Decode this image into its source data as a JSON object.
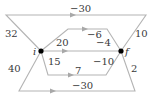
{
  "diagram": {
    "nodes": [
      {
        "id": "i",
        "label": "i",
        "x": 41,
        "y": 51,
        "lx": 33,
        "ly": 55
      },
      {
        "id": "f",
        "label": "f",
        "x": 121,
        "y": 51,
        "lx": 125,
        "ly": 55
      }
    ],
    "colors": {
      "edge": "#b4b4b4",
      "node": "#000000",
      "text": "#3a3a3a"
    },
    "paths": [
      {
        "name": "top-outer-path",
        "weight": "-30",
        "points": "41,51 6,15 146,15 121,51",
        "lx": 70,
        "ly": 12,
        "arrow": [
          72,
          15
        ]
      },
      {
        "name": "upper-hexagon-path",
        "weight": "-6",
        "points": "41,51 68,29 107,29 121,51",
        "lx": 87,
        "ly": 38,
        "arrow": [
          84,
          29
        ]
      },
      {
        "name": "direct-path",
        "weight": "",
        "points": "41,51 121,51",
        "lx": 0,
        "ly": 0,
        "arrow": [
          64,
          51
        ]
      },
      {
        "name": "lower-hexagon-path",
        "weight": "7",
        "points": "41,51 48,75 106,75 121,51",
        "lx": 75,
        "ly": 74,
        "arrow": [
          70,
          75
        ]
      },
      {
        "name": "bottom-outer-path",
        "weight": "-30",
        "points": "41,51 19,91 135,91 121,51",
        "lx": 72,
        "ly": 89,
        "arrow": [
          52,
          91
        ]
      }
    ],
    "edge_labels": [
      {
        "name": "label-32",
        "text": "32",
        "x": 5,
        "y": 37
      },
      {
        "name": "label-10",
        "text": "10",
        "x": 135,
        "y": 37
      },
      {
        "name": "label-20",
        "text": "20",
        "x": 56,
        "y": 46
      },
      {
        "name": "label-minus-4",
        "text": "−4",
        "x": 96,
        "y": 46
      },
      {
        "name": "label-15",
        "text": "15",
        "x": 48,
        "y": 65
      },
      {
        "name": "label-minus-10",
        "text": "−10",
        "x": 93,
        "y": 65
      },
      {
        "name": "label-2",
        "text": "2",
        "x": 131,
        "y": 72
      },
      {
        "name": "label-40",
        "text": "40",
        "x": 8,
        "y": 72
      }
    ]
  }
}
